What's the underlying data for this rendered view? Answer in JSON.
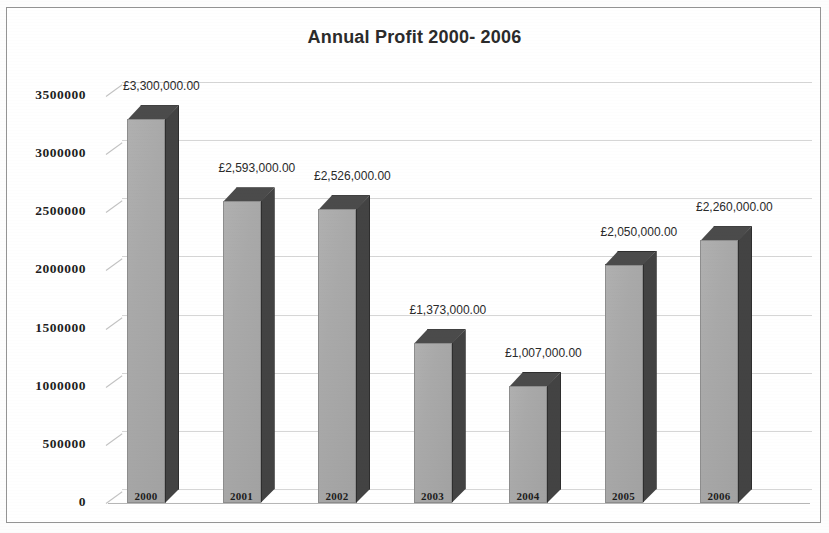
{
  "chart_data": {
    "type": "bar",
    "title": "Annual Profit 2000- 2006",
    "xlabel": "",
    "ylabel": "",
    "categories": [
      "2000",
      "2001",
      "2002",
      "2003",
      "2004",
      "2005",
      "2006"
    ],
    "values": [
      3300000,
      2593000,
      2526000,
      1373000,
      1007000,
      2050000,
      2260000
    ],
    "data_labels": [
      "£3,300,000.00",
      "£2,593,000.00",
      "£2,526,000.00",
      "£1,373,000.00",
      "£1,007,000.00",
      "£2,050,000.00",
      "£2,260,000.00"
    ],
    "ylim": [
      0,
      3500000
    ],
    "ytick_labels": [
      "0",
      "500000",
      "1000000",
      "1500000",
      "2000000",
      "2500000",
      "3000000",
      "3500000"
    ],
    "ytick_values": [
      0,
      500000,
      1000000,
      1500000,
      2000000,
      2500000,
      3000000,
      3500000
    ],
    "grid": true,
    "legend": false,
    "style": "3d-column",
    "currency_symbol": "£",
    "colors": {
      "bar_front": "#a9a9a9",
      "bar_side": "#434343",
      "bar_top": "#4b4b4b",
      "gridline": "#c9c9c9",
      "title_text": "#2b2b2b",
      "axis_text": "#1f1f1f",
      "border": "#8e8e8e",
      "background": "#ffffff"
    }
  }
}
